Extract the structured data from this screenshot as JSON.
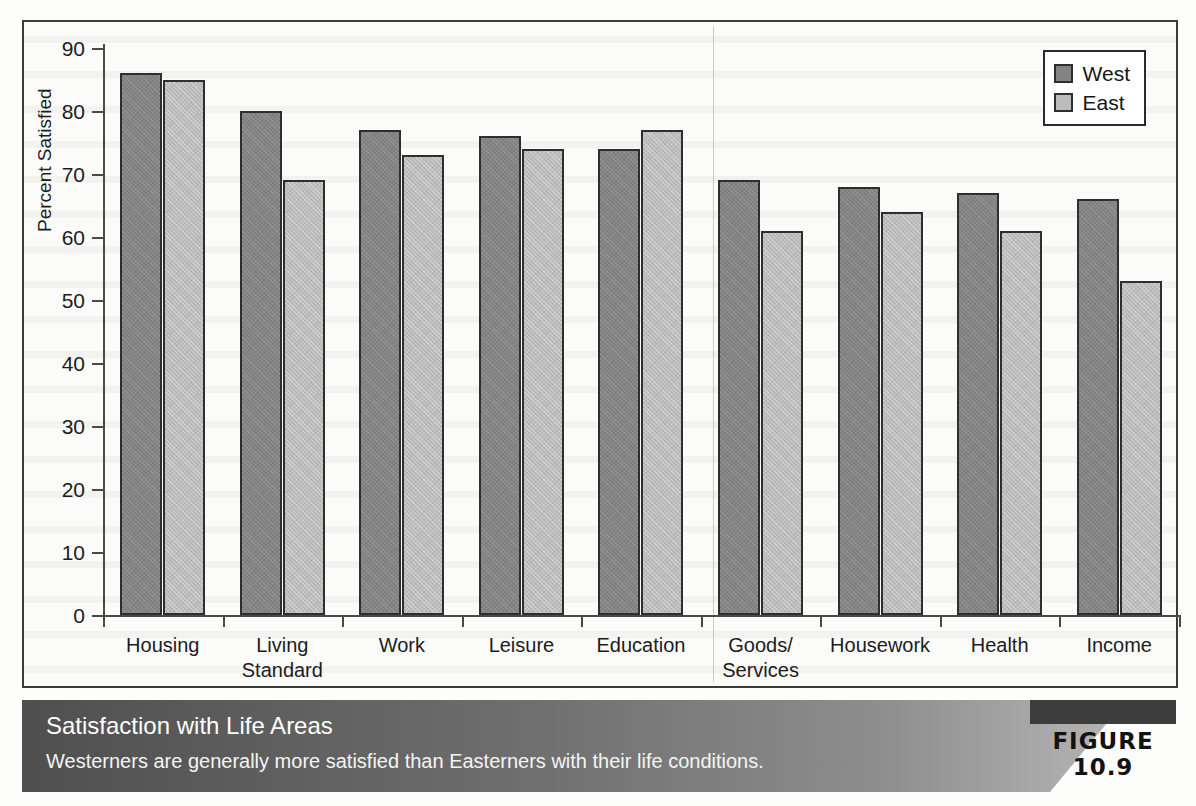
{
  "figure": {
    "badge": "FIGURE 10.9",
    "caption_title": "Satisfaction with Life Areas",
    "caption_subtitle": "Westerners are generally more satisfied than Easterners with their life conditions."
  },
  "legend": {
    "items": [
      {
        "label": "West",
        "color": "#838383"
      },
      {
        "label": "East",
        "color": "#bcbcbc"
      }
    ]
  },
  "axis": {
    "ylabel": "Percent Satisfied",
    "yticks": [
      "90",
      "80",
      "70",
      "60",
      "50",
      "40",
      "30",
      "20",
      "10",
      "0"
    ]
  },
  "chart_data": {
    "type": "bar",
    "title": "Satisfaction with Life Areas",
    "subtitle": "Westerners are generally more satisfied than Easterners with their life conditions.",
    "xlabel": "",
    "ylabel": "Percent Satisfied",
    "ylim": [
      0,
      90
    ],
    "ytick_step": 10,
    "grid": false,
    "legend_position": "top-right",
    "categories": [
      "Housing",
      "Living Standard",
      "Work",
      "Leisure",
      "Education",
      "Goods/ Services",
      "Housework",
      "Health",
      "Income"
    ],
    "category_lines": [
      [
        "Housing"
      ],
      [
        "Living",
        "Standard"
      ],
      [
        "Work"
      ],
      [
        "Leisure"
      ],
      [
        "Education"
      ],
      [
        "Goods/",
        "Services"
      ],
      [
        "Housework"
      ],
      [
        "Health"
      ],
      [
        "Income"
      ]
    ],
    "series": [
      {
        "name": "West",
        "color": "#838383",
        "values": [
          86,
          80,
          77,
          76,
          74,
          69,
          68,
          67,
          66
        ]
      },
      {
        "name": "East",
        "color": "#bcbcbc",
        "values": [
          85,
          69,
          73,
          74,
          77,
          61,
          64,
          61,
          53
        ]
      }
    ]
  }
}
